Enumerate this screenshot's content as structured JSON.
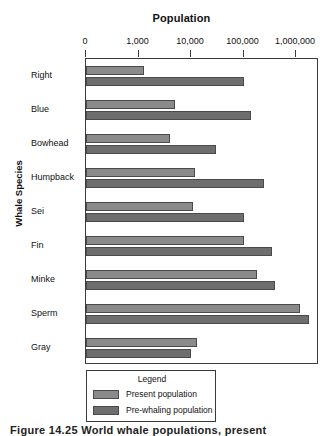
{
  "chart_data": {
    "type": "bar",
    "orientation": "horizontal",
    "title": "Population",
    "xlabel": "Population",
    "ylabel": "Whale Species",
    "xscale": "log",
    "xlim": [
      100,
      3000000
    ],
    "xticks": [
      0,
      1000,
      10000,
      100000,
      1000000
    ],
    "xtick_labels": [
      "0",
      "1,000",
      "10,000",
      "100,000",
      "1,000,000"
    ],
    "grid": false,
    "legend_position": "bottom-left",
    "legend_title": "Legend",
    "categories": [
      "Right",
      "Blue",
      "Bowhead",
      "Humpback",
      "Sei",
      "Fin",
      "Minke",
      "Sperm",
      "Gray"
    ],
    "series": [
      {
        "name": "Present population",
        "color": "#8a8a8a",
        "values": [
          1300,
          5000,
          4000,
          12000,
          11000,
          100000,
          180000,
          1200000,
          13000
        ]
      },
      {
        "name": "Pre-whaling population",
        "color": "#6e6e6e",
        "values": [
          100000,
          140000,
          30000,
          250000,
          100000,
          350000,
          400000,
          1800000,
          10000
        ]
      }
    ]
  },
  "caption": "Figure 14.25    World whale populations, present",
  "colors": {
    "present": "#8a8a8a",
    "prewhaling": "#6e6e6e",
    "axis": "#3b3b3b",
    "text": "#111111"
  }
}
